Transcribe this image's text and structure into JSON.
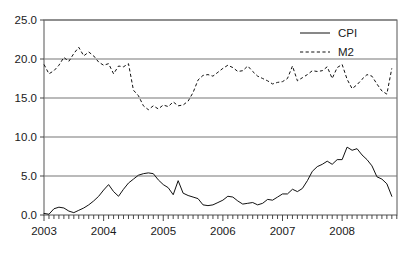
{
  "chart_data": {
    "type": "line",
    "title": "",
    "subtitle": "",
    "xlabel": "",
    "ylabel": "",
    "xlim": [
      2003.0,
      2008.92
    ],
    "ylim": [
      0.0,
      25.0
    ],
    "grid": true,
    "grid_axis": "y",
    "legend_position": "top-right",
    "x_tick_labels": [
      "2003",
      "2004",
      "2005",
      "2006",
      "2007",
      "2008"
    ],
    "x_tick_values": [
      2003,
      2004,
      2005,
      2006,
      2007,
      2008
    ],
    "x_minor_tick_interval_months": 1,
    "y_tick_labels": [
      "0.0",
      "5.0",
      "10.0",
      "15.0",
      "20.0",
      "25.0"
    ],
    "y_tick_values": [
      0.0,
      5.0,
      10.0,
      15.0,
      20.0,
      25.0
    ],
    "x": [
      2003.0,
      2003.083,
      2003.167,
      2003.25,
      2003.333,
      2003.417,
      2003.5,
      2003.583,
      2003.667,
      2003.75,
      2003.833,
      2003.917,
      2004.0,
      2004.083,
      2004.167,
      2004.25,
      2004.333,
      2004.417,
      2004.5,
      2004.583,
      2004.667,
      2004.75,
      2004.833,
      2004.917,
      2005.0,
      2005.083,
      2005.167,
      2005.25,
      2005.333,
      2005.417,
      2005.5,
      2005.583,
      2005.667,
      2005.75,
      2005.833,
      2005.917,
      2006.0,
      2006.083,
      2006.167,
      2006.25,
      2006.333,
      2006.417,
      2006.5,
      2006.583,
      2006.667,
      2006.75,
      2006.833,
      2006.917,
      2007.0,
      2007.083,
      2007.167,
      2007.25,
      2007.333,
      2007.417,
      2007.5,
      2007.583,
      2007.667,
      2007.75,
      2007.833,
      2007.917,
      2008.0,
      2008.083,
      2008.167,
      2008.25,
      2008.333,
      2008.417,
      2008.5,
      2008.583,
      2008.667,
      2008.75,
      2008.833
    ],
    "series": [
      {
        "name": "CPI",
        "style": "solid",
        "color": "#111111",
        "values": [
          0.2,
          0.1,
          0.8,
          1.0,
          0.9,
          0.5,
          0.3,
          0.6,
          0.9,
          1.3,
          1.8,
          2.4,
          3.2,
          3.9,
          3.0,
          2.4,
          3.3,
          4.1,
          4.6,
          5.1,
          5.3,
          5.4,
          5.3,
          4.5,
          3.9,
          3.5,
          2.6,
          4.4,
          2.8,
          2.5,
          2.3,
          2.1,
          1.3,
          1.2,
          1.3,
          1.6,
          1.9,
          2.4,
          2.3,
          1.8,
          1.4,
          1.5,
          1.6,
          1.3,
          1.5,
          2.0,
          1.9,
          2.3,
          2.7,
          2.7,
          3.3,
          3.0,
          3.4,
          4.4,
          5.6,
          6.2,
          6.5,
          6.9,
          6.5,
          7.1,
          7.1,
          8.7,
          8.3,
          8.5,
          7.7,
          7.1,
          6.3,
          4.9,
          4.6,
          4.0,
          2.4
        ]
      },
      {
        "name": "M2",
        "style": "dashed",
        "color": "#111111",
        "values": [
          19.3,
          18.1,
          18.5,
          19.2,
          20.2,
          19.7,
          20.7,
          21.5,
          20.4,
          20.9,
          20.4,
          19.6,
          19.2,
          19.4,
          18.1,
          19.1,
          19.0,
          19.4,
          16.0,
          15.3,
          14.0,
          13.5,
          14.0,
          13.6,
          14.1,
          13.9,
          14.5,
          14.0,
          14.1,
          14.6,
          15.7,
          17.3,
          17.9,
          18.0,
          17.8,
          18.3,
          18.8,
          19.2,
          18.9,
          18.4,
          18.5,
          19.1,
          18.4,
          17.8,
          17.5,
          17.2,
          16.8,
          17.0,
          17.1,
          17.5,
          19.1,
          17.2,
          17.6,
          18.0,
          18.5,
          18.4,
          18.5,
          19.0,
          17.5,
          18.9,
          19.3,
          17.4,
          16.2,
          16.7,
          17.4,
          18.0,
          17.8,
          16.8,
          15.9,
          15.5,
          18.8
        ]
      }
    ]
  },
  "legend": {
    "entries": [
      {
        "label": "CPI",
        "style": "solid"
      },
      {
        "label": "M2",
        "style": "dashed"
      }
    ]
  }
}
